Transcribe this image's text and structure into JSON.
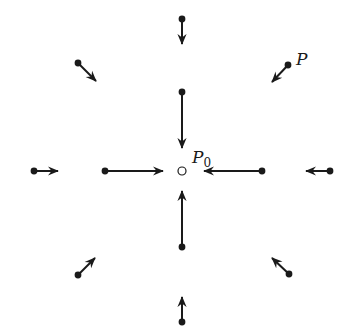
{
  "diagram": {
    "title": "",
    "colors": {
      "ink": "#1a1a1a",
      "background": "#ffffff"
    },
    "center": {
      "label": "P",
      "subscript": "0",
      "x": 182,
      "y": 171,
      "marker": "open-circle"
    },
    "point_label": {
      "label": "P",
      "x": 296,
      "y": 65
    },
    "arrows": [
      {
        "id": "inner-top",
        "from": [
          182,
          92
        ],
        "to": [
          182,
          148
        ]
      },
      {
        "id": "inner-bottom",
        "from": [
          182,
          247
        ],
        "to": [
          182,
          191
        ]
      },
      {
        "id": "inner-left",
        "from": [
          105,
          171
        ],
        "to": [
          163,
          171
        ]
      },
      {
        "id": "inner-right",
        "from": [
          262,
          171
        ],
        "to": [
          204,
          171
        ]
      },
      {
        "id": "outer-top",
        "from": [
          182,
          19
        ],
        "to": [
          182,
          44
        ]
      },
      {
        "id": "outer-bottom",
        "from": [
          182,
          322
        ],
        "to": [
          182,
          297
        ]
      },
      {
        "id": "outer-left",
        "from": [
          34,
          171
        ],
        "to": [
          58,
          171
        ]
      },
      {
        "id": "outer-right",
        "from": [
          330,
          171
        ],
        "to": [
          306,
          171
        ]
      },
      {
        "id": "outer-top-left",
        "from": [
          78,
          63
        ],
        "to": [
          96,
          81
        ]
      },
      {
        "id": "outer-top-right",
        "from": [
          288,
          65
        ],
        "to": [
          272,
          82
        ]
      },
      {
        "id": "outer-bottom-left",
        "from": [
          78,
          275
        ],
        "to": [
          95,
          258
        ]
      },
      {
        "id": "outer-bottom-right",
        "from": [
          289,
          274
        ],
        "to": [
          272,
          258
        ]
      }
    ]
  }
}
